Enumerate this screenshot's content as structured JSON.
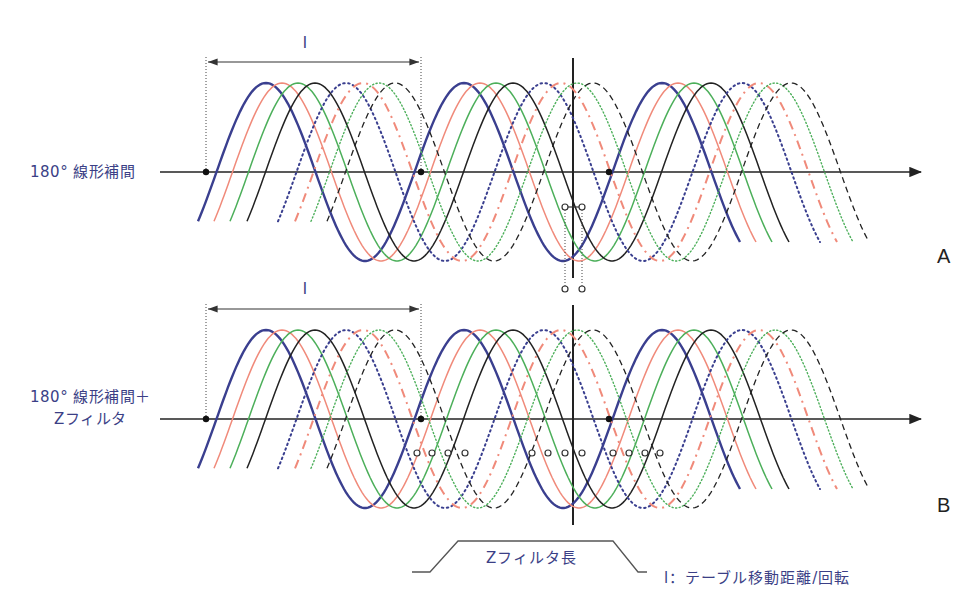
{
  "colors": {
    "label_text": "#3b3f86",
    "axis": "#222222",
    "blue": "#3a3f8f",
    "red": "#f08a7a",
    "green": "#4caf5a",
    "black": "#222222"
  },
  "panels": [
    {
      "id": "A",
      "label_lines": [
        "180° 線形補間"
      ],
      "marker": "dual-sample-points"
    },
    {
      "id": "B",
      "label_lines": [
        "180° 線形補間＋",
        "Zフィルタ"
      ],
      "marker": "filter-sample-points"
    }
  ],
  "dimension_label": "l",
  "curves": [
    {
      "name": "curve-1",
      "color": "blue",
      "style": "solid-bold"
    },
    {
      "name": "curve-2",
      "color": "red",
      "style": "solid"
    },
    {
      "name": "curve-3",
      "color": "green",
      "style": "solid"
    },
    {
      "name": "curve-4",
      "color": "black",
      "style": "solid"
    },
    {
      "name": "curve-5",
      "color": "blue",
      "style": "dotted"
    },
    {
      "name": "curve-6",
      "color": "red",
      "style": "dash-dot"
    },
    {
      "name": "curve-7",
      "color": "green",
      "style": "dotted-fine"
    },
    {
      "name": "curve-8",
      "color": "black",
      "style": "dashed"
    }
  ],
  "footer": {
    "filter_length_label": "Zフィルタ長",
    "legend": "l：テーブル移動距離/回転"
  }
}
